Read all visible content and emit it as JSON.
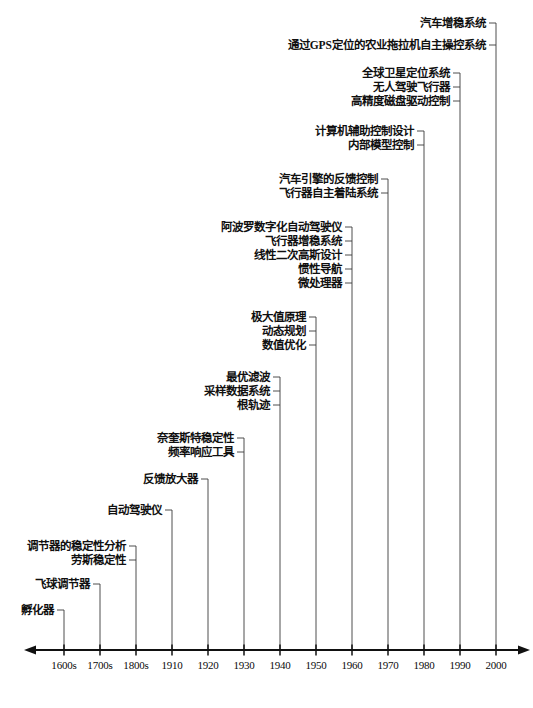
{
  "chart_data": {
    "type": "table",
    "title": "",
    "subtitle": "",
    "xlabel": "",
    "ylabel": "",
    "grid": false,
    "legend": null,
    "axis": {
      "orientation": "horizontal",
      "arrow_left": true,
      "arrow_right": true,
      "y_px": 650,
      "x_start_px": 34,
      "x_end_px": 520,
      "tick_spacing_px": 36,
      "first_tick_px": 64
    },
    "categories": [
      "1600s",
      "1700s",
      "1800s",
      "1910",
      "1920",
      "1930",
      "1940",
      "1950",
      "1960",
      "1970",
      "1980",
      "1990",
      "2000"
    ],
    "tick_labels": [
      "1600s",
      "1700s",
      "1800s",
      "1910",
      "1920",
      "1930",
      "1940",
      "1950",
      "1960",
      "1970",
      "1980",
      "1990",
      "2000"
    ],
    "series": [
      {
        "name": "1600s",
        "year": "1600s",
        "tick_index": 0,
        "x_px": 64,
        "items": [
          "孵化器"
        ],
        "label_y_px": [
          610
        ]
      },
      {
        "name": "1700s",
        "year": "1700s",
        "tick_index": 1,
        "x_px": 100,
        "items": [
          "飞球调节器"
        ],
        "label_y_px": [
          584
        ]
      },
      {
        "name": "1800s",
        "year": "1800s",
        "tick_index": 2,
        "x_px": 136,
        "items": [
          "调节器的稳定性分析",
          "劳斯稳定性"
        ],
        "label_y_px": [
          546,
          560
        ]
      },
      {
        "name": "1910",
        "year": "1910",
        "tick_index": 3,
        "x_px": 172,
        "items": [
          "自动驾驶仪"
        ],
        "label_y_px": [
          510
        ]
      },
      {
        "name": "1920",
        "year": "1920",
        "tick_index": 4,
        "x_px": 208,
        "items": [
          "反馈放大器"
        ],
        "label_y_px": [
          479
        ]
      },
      {
        "name": "1930",
        "year": "1930",
        "tick_index": 5,
        "x_px": 244,
        "items": [
          "奈奎斯特稳定性",
          "频率响应工具"
        ],
        "label_y_px": [
          438,
          452
        ]
      },
      {
        "name": "1940",
        "year": "1940",
        "tick_index": 6,
        "x_px": 280,
        "items": [
          "最优滤波",
          "采样数据系统",
          "根轨迹"
        ],
        "label_y_px": [
          377,
          391,
          405
        ]
      },
      {
        "name": "1950",
        "year": "1950",
        "tick_index": 7,
        "x_px": 316,
        "items": [
          "极大值原理",
          "动态规划",
          "数值优化"
        ],
        "label_y_px": [
          317,
          331,
          345
        ]
      },
      {
        "name": "1960",
        "year": "1960",
        "tick_index": 8,
        "x_px": 352,
        "items": [
          "阿波罗数字化自动驾驶仪",
          "飞行器增稳系统",
          "线性二次高斯设计",
          "惯性导航",
          "微处理器"
        ],
        "label_y_px": [
          227,
          241,
          255,
          269,
          283
        ]
      },
      {
        "name": "1970",
        "year": "1970",
        "tick_index": 9,
        "x_px": 388,
        "items": [
          "汽车引擎的反馈控制",
          "飞行器自主着陆系统"
        ],
        "label_y_px": [
          179,
          193
        ]
      },
      {
        "name": "1980",
        "year": "1980",
        "tick_index": 10,
        "x_px": 424,
        "items": [
          "计算机辅助控制设计",
          "内部模型控制"
        ],
        "label_y_px": [
          131,
          145
        ]
      },
      {
        "name": "1990",
        "year": "1990",
        "tick_index": 11,
        "x_px": 460,
        "items": [
          "全球卫星定位系统",
          "无人驾驶飞行器",
          "高精度磁盘驱动控制"
        ],
        "label_y_px": [
          73,
          87,
          101
        ]
      },
      {
        "name": "2000",
        "year": "2000",
        "tick_index": 12,
        "x_px": 496,
        "items": [
          "汽车增稳系统",
          "通过GPS定位的农业拖拉机自主操控系统"
        ],
        "label_y_px": [
          23,
          45
        ]
      }
    ],
    "annotations": []
  },
  "colors": {
    "axis": "#111111",
    "connector": "#3a3a3a",
    "label_text": "#101010",
    "tick_text": "#0b0b0b",
    "background": "#ffffff"
  }
}
